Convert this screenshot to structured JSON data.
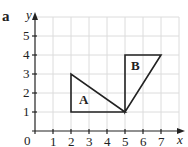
{
  "part_label": "a",
  "axes": {
    "x_label": "x",
    "y_label": "y",
    "origin_label": "0",
    "x_ticks": [
      "1",
      "2",
      "3",
      "4",
      "5",
      "6",
      "7"
    ],
    "y_ticks": [
      "1",
      "2",
      "3",
      "4",
      "5"
    ]
  },
  "shapes": [
    {
      "name": "A",
      "vertices": [
        [
          2,
          1
        ],
        [
          2,
          3
        ],
        [
          5,
          1
        ]
      ]
    },
    {
      "name": "B",
      "vertices": [
        [
          5,
          1
        ],
        [
          5,
          4
        ],
        [
          7,
          4
        ]
      ]
    }
  ],
  "colors": {
    "grid": "#d9d9d9",
    "axis": "#222222",
    "shape": "#222222"
  }
}
